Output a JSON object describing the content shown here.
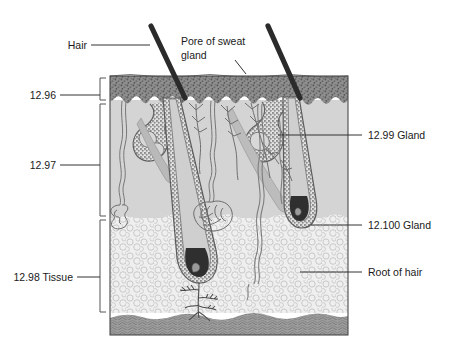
{
  "figure": {
    "background_color": "#ffffff"
  },
  "labels": {
    "left": [
      {
        "name": "hair",
        "text": "Hair"
      },
      {
        "name": "layer-1",
        "text": "12.96"
      },
      {
        "name": "layer-2",
        "text": "12.97"
      },
      {
        "name": "layer-3",
        "text": "12.98 Tissue"
      }
    ],
    "top": [
      {
        "name": "pore-line-1",
        "text": "Pore of sweat"
      },
      {
        "name": "pore-line-2",
        "text": "gland"
      }
    ],
    "right": [
      {
        "name": "gland-99",
        "text": "12.99 Gland"
      },
      {
        "name": "gland-100",
        "text": "12.100 Gland"
      },
      {
        "name": "root-of-hair",
        "text": "Root of hair"
      }
    ]
  },
  "colors": {
    "epidermis": "#8c8c8c",
    "dermis": "#d2d2d2",
    "subcutaneous": "#ededed",
    "muscle": "#9a9a9a",
    "hair_shaft": "#2a2a2a",
    "outline": "#4a4a4a",
    "leader": "#333333",
    "text": "#1a1a1a"
  },
  "structures": [
    {
      "name": "hair-shaft-left",
      "kind": "hair"
    },
    {
      "name": "hair-shaft-right",
      "kind": "hair"
    },
    {
      "name": "sweat-pore",
      "kind": "pore"
    },
    {
      "name": "sebaceous-gland",
      "kind": "gland"
    },
    {
      "name": "sweat-gland-coil",
      "kind": "gland"
    },
    {
      "name": "hair-follicle",
      "kind": "follicle"
    },
    {
      "name": "hair-root-papilla",
      "kind": "root"
    },
    {
      "name": "nerve-endings",
      "kind": "nerve"
    },
    {
      "name": "blood-vessels",
      "kind": "vessel"
    },
    {
      "name": "arrector-pili-muscle",
      "kind": "muscle"
    }
  ]
}
